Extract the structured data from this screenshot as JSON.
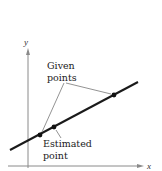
{
  "figure": {
    "type": "diagram",
    "axes": {
      "x_label": "x",
      "y_label": "y"
    },
    "annotations": {
      "given_points_line1": "Given",
      "given_points_line2": "points",
      "estimated_point_line1": "Estimated",
      "estimated_point_line2": "point"
    },
    "points": {
      "given": [
        {
          "x": 40,
          "y": 135
        },
        {
          "x": 114,
          "y": 95
        }
      ],
      "estimated": {
        "x": 54,
        "y": 127
      }
    },
    "line": {
      "x1": 10,
      "y1": 150,
      "x2": 138,
      "y2": 82
    },
    "colors": {
      "axis": "#888888",
      "line": "#1a1a1a",
      "points": "#111111",
      "leader": "#777777"
    }
  }
}
